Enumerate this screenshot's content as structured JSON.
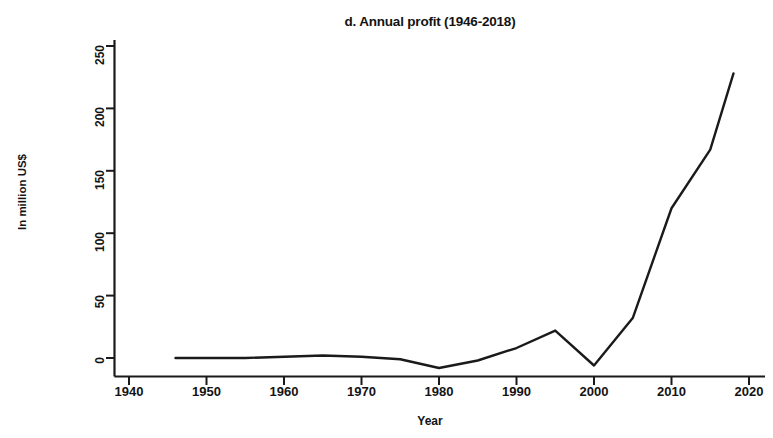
{
  "figure": {
    "panel_label": "d.",
    "background_color": "#ffffff",
    "line_color": "#1a1a1a"
  },
  "chart_data": {
    "type": "line",
    "title": "d. Annual profit (1946-2018)",
    "xlabel": "Year",
    "ylabel": "In million US$",
    "xlim": [
      1938,
      2022
    ],
    "ylim": [
      -20,
      262
    ],
    "xticks": [
      1940,
      1950,
      1960,
      1970,
      1980,
      1990,
      2000,
      2010,
      2020
    ],
    "xtick_labels": [
      "1940",
      "1950",
      "1960",
      "1970",
      "1980",
      "1990",
      "2000",
      "2010",
      "2020"
    ],
    "yticks": [
      0,
      50,
      100,
      150,
      200,
      250
    ],
    "ytick_labels": [
      "0",
      "50",
      "100",
      "150",
      "200",
      "250"
    ],
    "grid": false,
    "legend": null,
    "series": [
      {
        "name": "Annual profit",
        "x": [
          1946,
          1955,
          1965,
          1970,
          1975,
          1980,
          1985,
          1990,
          1995,
          2000,
          2005,
          2010,
          2015,
          2018
        ],
        "values": [
          0,
          0,
          2,
          1,
          -1,
          -8,
          -2,
          8,
          22,
          -6,
          32,
          120,
          167,
          228
        ]
      }
    ]
  }
}
